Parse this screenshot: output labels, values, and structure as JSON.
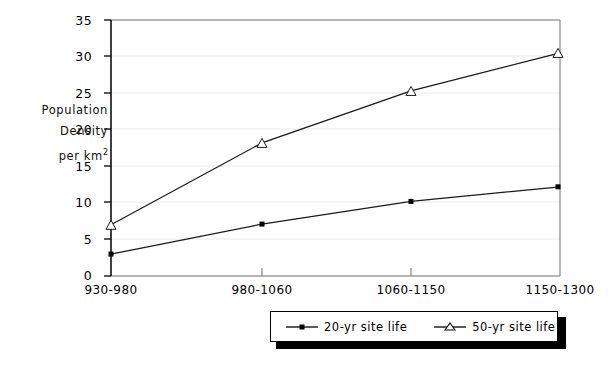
{
  "chart_data": {
    "type": "line",
    "title": "",
    "xlabel": "",
    "ylabel": "Population Density per km 2",
    "categories": [
      "930-980",
      "980-1060",
      "1060-1150",
      "1150-1300"
    ],
    "series": [
      {
        "name": "20-yr site life",
        "marker": "square-dot",
        "values": [
          3.0,
          7.1,
          10.2,
          12.2
        ]
      },
      {
        "name": "50-yr site life",
        "marker": "open-triangle",
        "values": [
          7.0,
          18.2,
          25.3,
          30.5
        ]
      }
    ],
    "ylim": [
      0,
      35
    ],
    "yticks": [
      0,
      5,
      10,
      15,
      20,
      25,
      30,
      35
    ],
    "grid": true,
    "legend_position": "bottom"
  },
  "axis": {
    "y_label_line1": "Population",
    "y_label_line2": "Density",
    "y_label_line3_prefix": "per km",
    "y_label_line3_sup": "2",
    "y_ticks": [
      "35",
      "30",
      "25",
      "20",
      "15",
      "10",
      "5",
      "0"
    ],
    "x_ticks": [
      "930-980",
      "980-1060",
      "1060-1150",
      "1150-1300"
    ]
  },
  "legend": {
    "items": [
      {
        "label": "20-yr site life",
        "marker": "square-dot"
      },
      {
        "label": "50-yr site life",
        "marker": "open-triangle"
      }
    ]
  },
  "colors": {
    "ink": "#000000",
    "grid": "#e8e8e8",
    "frame": "#6a6a6a",
    "background": "#ffffff"
  }
}
